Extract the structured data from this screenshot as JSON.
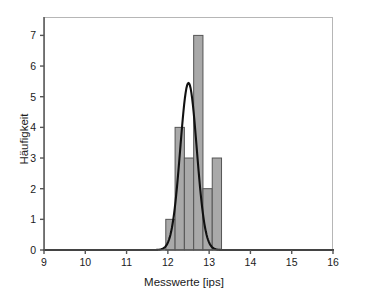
{
  "chart_data": {
    "type": "bar",
    "title": "",
    "subtitle": "",
    "xlabel": "Messwerte [ips]",
    "ylabel": "Häufigkeit",
    "xlim": [
      9,
      16
    ],
    "ylim": [
      0,
      7.6
    ],
    "xticks": [
      9,
      10,
      11,
      12,
      13,
      14,
      15,
      16
    ],
    "xtick_labels": [
      "9",
      "10",
      "11",
      "12",
      "13",
      "14",
      "15",
      "16"
    ],
    "yticks": [
      0,
      1,
      2,
      3,
      4,
      5,
      6,
      7
    ],
    "ytick_labels": [
      "0",
      "1",
      "2",
      "3",
      "4",
      "5",
      "6",
      "7"
    ],
    "grid": false,
    "legend": null,
    "bin_edges": [
      11.95,
      12.175,
      12.4,
      12.625,
      12.85,
      13.075,
      13.3
    ],
    "bin_width": 0.225,
    "categories": [
      "11.95-12.18",
      "12.18-12.40",
      "12.40-12.63",
      "12.63-12.85",
      "12.85-13.08",
      "13.08-13.30"
    ],
    "values": [
      1,
      4,
      3,
      7,
      2,
      3
    ],
    "bin_centers": [
      12.06,
      12.29,
      12.51,
      12.74,
      12.96,
      13.19
    ],
    "bar_fill_color": "#a9a9a9",
    "bar_edge_color": "#555555",
    "overlay": {
      "type": "line",
      "name": "Normalverteilung",
      "color": "#111111",
      "peak_x": 12.5,
      "peak_y": 5.45,
      "mean": 12.5,
      "sigma": 0.2,
      "amplitude": 5.45
    },
    "n_total": 20
  },
  "axis": {
    "frame_color": "#b6b6b6",
    "axis_color": "#555555"
  }
}
